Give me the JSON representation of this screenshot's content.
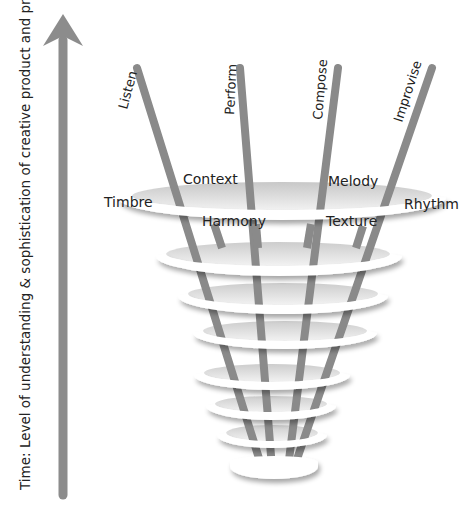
{
  "diagram": {
    "axis": {
      "label": "Time: Level of understanding & sophistication of creative product and process",
      "arrow_color": "#8c8c8c",
      "direction": "up"
    },
    "poles": [
      {
        "label": "Listen"
      },
      {
        "label": "Perform"
      },
      {
        "label": "Compose"
      },
      {
        "label": "Improvise"
      }
    ],
    "elements": [
      {
        "label": "Timbre"
      },
      {
        "label": "Context"
      },
      {
        "label": "Harmony"
      },
      {
        "label": "Melody"
      },
      {
        "label": "Texture"
      },
      {
        "label": "Rhythm"
      }
    ],
    "spiral": {
      "ring_count": 8,
      "ring_color": "#ffffff",
      "shadow_color": "#bdbdbd",
      "pole_color": "#8a8a8a"
    }
  }
}
